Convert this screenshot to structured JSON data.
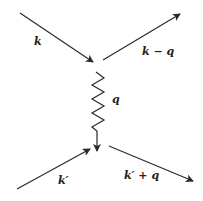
{
  "diagram": {
    "type": "feynman-diagram",
    "labels": {
      "incoming_top": "k",
      "outgoing_top": "k − q",
      "propagator": "q",
      "incoming_bottom": "k′",
      "outgoing_bottom": "k′ + q"
    },
    "colors": {
      "line": "#2a2a2a",
      "background": "#ffffff"
    }
  }
}
